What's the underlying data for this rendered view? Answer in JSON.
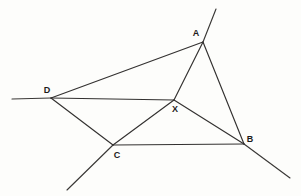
{
  "figure": {
    "width": 301,
    "height": 196,
    "background_color": "#fdfdfb",
    "line_color": "#333130",
    "label_color": "#1d1b1a"
  },
  "points": [
    {
      "id": "A",
      "label": "A",
      "x": 203,
      "y": 42,
      "label_x": 196,
      "label_y": 33
    },
    {
      "id": "B",
      "label": "B",
      "x": 244,
      "y": 144,
      "label_x": 250,
      "label_y": 139
    },
    {
      "id": "C",
      "label": "C",
      "x": 113,
      "y": 145,
      "label_x": 117,
      "label_y": 155
    },
    {
      "id": "D",
      "label": "D",
      "x": 51,
      "y": 98,
      "label_x": 47,
      "label_y": 90
    },
    {
      "id": "X",
      "label": "X",
      "x": 174,
      "y": 100,
      "label_x": 175,
      "label_y": 109
    }
  ],
  "segments": [
    {
      "id": "DA",
      "from": "D",
      "to": "A",
      "x1": 51,
      "y1": 98,
      "x2": 203,
      "y2": 42
    },
    {
      "id": "AB",
      "from": "A",
      "to": "B",
      "x1": 203,
      "y1": 42,
      "x2": 244,
      "y2": 144
    },
    {
      "id": "CB",
      "from": "C",
      "to": "B",
      "x1": 113,
      "y1": 145,
      "x2": 244,
      "y2": 144
    },
    {
      "id": "DC",
      "from": "D",
      "to": "C",
      "x1": 51,
      "y1": 98,
      "x2": 113,
      "y2": 145
    },
    {
      "id": "DX",
      "from": "D",
      "to": "X",
      "x1": 51,
      "y1": 98,
      "x2": 174,
      "y2": 100
    },
    {
      "id": "XA",
      "from": "X",
      "to": "A",
      "x1": 174,
      "y1": 100,
      "x2": 203,
      "y2": 42
    },
    {
      "id": "XB",
      "from": "X",
      "to": "B",
      "x1": 174,
      "y1": 100,
      "x2": 244,
      "y2": 144
    },
    {
      "id": "XC",
      "from": "X",
      "to": "C",
      "x1": 174,
      "y1": 100,
      "x2": 113,
      "y2": 145
    }
  ],
  "rays": [
    {
      "id": "ray-A-up-right",
      "through": "A",
      "x1": 203,
      "y1": 42,
      "x2": 216,
      "y2": 9
    },
    {
      "id": "ray-D-left",
      "through": "D",
      "x1": 51,
      "y1": 98,
      "x2": 12,
      "y2": 99
    },
    {
      "id": "ray-B-down-right",
      "through": "B",
      "x1": 244,
      "y1": 144,
      "x2": 290,
      "y2": 178
    },
    {
      "id": "ray-C-down-left",
      "through": "C",
      "x1": 113,
      "y1": 145,
      "x2": 67,
      "y2": 190
    }
  ]
}
